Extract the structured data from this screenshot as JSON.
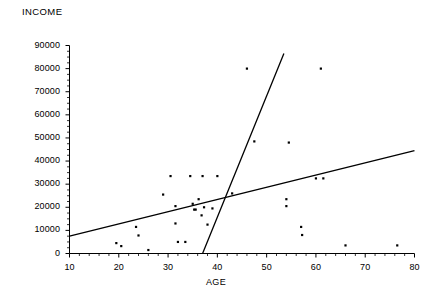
{
  "chart_data": {
    "type": "scatter",
    "title": "INCOME",
    "xlabel": "AGE",
    "ylabel": "INCOME",
    "xlim": [
      10,
      80
    ],
    "ylim": [
      0,
      90000
    ],
    "grid": false,
    "legend": "none",
    "x_ticks": [
      10,
      20,
      30,
      40,
      50,
      60,
      70,
      80
    ],
    "x_tick_labels": [
      "10",
      "20",
      "30",
      "40",
      "50",
      "60",
      "70",
      "80"
    ],
    "y_ticks": [
      0,
      10000,
      20000,
      30000,
      40000,
      50000,
      60000,
      70000,
      80000,
      90000
    ],
    "y_tick_labels": [
      "0",
      "10000",
      "20000",
      "30000",
      "40000",
      "50000",
      "60000",
      "70000",
      "80000",
      "90000"
    ],
    "x_minor_tick_step": 2,
    "y_minor_tick_step": 2500,
    "points": [
      {
        "x": 19.5,
        "y": 4500
      },
      {
        "x": 20.5,
        "y": 3200
      },
      {
        "x": 23.5,
        "y": 11500
      },
      {
        "x": 24.0,
        "y": 7800
      },
      {
        "x": 26.0,
        "y": 1500
      },
      {
        "x": 29.0,
        "y": 25500
      },
      {
        "x": 30.5,
        "y": 33500
      },
      {
        "x": 31.5,
        "y": 20500
      },
      {
        "x": 31.5,
        "y": 13000
      },
      {
        "x": 32.0,
        "y": 5000
      },
      {
        "x": 33.5,
        "y": 5000
      },
      {
        "x": 34.5,
        "y": 33500
      },
      {
        "x": 35.0,
        "y": 21500
      },
      {
        "x": 35.3,
        "y": 19000
      },
      {
        "x": 35.6,
        "y": 19000
      },
      {
        "x": 36.2,
        "y": 23500
      },
      {
        "x": 36.8,
        "y": 16500
      },
      {
        "x": 37.0,
        "y": 33500
      },
      {
        "x": 37.3,
        "y": 20000
      },
      {
        "x": 38.0,
        "y": 12500
      },
      {
        "x": 39.0,
        "y": 19500
      },
      {
        "x": 40.0,
        "y": 33500
      },
      {
        "x": 43.0,
        "y": 26000
      },
      {
        "x": 46.0,
        "y": 80000
      },
      {
        "x": 47.5,
        "y": 48500
      },
      {
        "x": 54.5,
        "y": 48000
      },
      {
        "x": 54.0,
        "y": 23500
      },
      {
        "x": 54.0,
        "y": 20500
      },
      {
        "x": 57.0,
        "y": 11500
      },
      {
        "x": 57.2,
        "y": 8000
      },
      {
        "x": 60.0,
        "y": 32500
      },
      {
        "x": 61.0,
        "y": 80000
      },
      {
        "x": 61.5,
        "y": 32500
      },
      {
        "x": 66.0,
        "y": 3500
      },
      {
        "x": 76.5,
        "y": 3500
      }
    ],
    "lines": [
      {
        "name": "shallow-regression-line",
        "x1": 10,
        "y1": 7500,
        "x2": 80,
        "y2": 44500,
        "color": "#000000"
      },
      {
        "name": "steep-regression-line",
        "x1": 37,
        "y1": 0,
        "x2": 53.5,
        "y2": 86500,
        "color": "#000000"
      }
    ]
  }
}
